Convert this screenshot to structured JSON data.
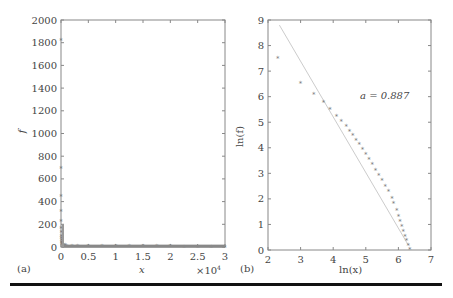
{
  "chart_data": [
    {
      "panel": "(a)",
      "type": "scatter",
      "title": "",
      "xlabel": "x",
      "ylabel": "f",
      "x_multiplier": "×10⁴",
      "xlim": [
        0,
        3
      ],
      "ylim": [
        0,
        2000
      ],
      "xticks": [
        "0",
        "0.5",
        "1",
        "1.5",
        "2",
        "2.5",
        "3"
      ],
      "yticks": [
        "0",
        "200",
        "400",
        "600",
        "800",
        "1000",
        "1200",
        "1400",
        "1600",
        "1800",
        "2000"
      ],
      "grid": false,
      "marker": "*",
      "points": [
        [
          0.0002,
          1820
        ],
        [
          0.0005,
          700
        ],
        [
          0.0008,
          450
        ],
        [
          0.001,
          320
        ],
        [
          0.0015,
          230
        ],
        [
          0.002,
          170
        ],
        [
          0.003,
          130
        ],
        [
          0.004,
          100
        ],
        [
          0.005,
          80
        ],
        [
          0.007,
          60
        ],
        [
          0.01,
          45
        ],
        [
          0.015,
          35
        ],
        [
          0.02,
          28
        ],
        [
          0.03,
          22
        ],
        [
          0.05,
          18
        ],
        [
          0.08,
          14
        ],
        [
          0.1,
          12
        ],
        [
          0.2,
          10
        ],
        [
          0.3,
          9
        ],
        [
          0.5,
          8
        ],
        [
          0.75,
          7
        ],
        [
          1.0,
          7
        ],
        [
          1.25,
          6
        ],
        [
          1.5,
          6
        ],
        [
          1.75,
          5
        ],
        [
          2.0,
          5
        ],
        [
          2.25,
          4
        ],
        [
          2.5,
          4
        ],
        [
          2.75,
          3
        ],
        [
          3.0,
          3
        ]
      ]
    },
    {
      "panel": "(b)",
      "type": "scatter",
      "title": "",
      "xlabel": "ln(x)",
      "ylabel": "ln(f)",
      "xlim": [
        2,
        7
      ],
      "ylim": [
        0,
        9
      ],
      "xticks": [
        "2",
        "3",
        "4",
        "5",
        "6",
        "7"
      ],
      "yticks": [
        "0",
        "1",
        "2",
        "3",
        "4",
        "5",
        "6",
        "7",
        "8",
        "9"
      ],
      "grid": false,
      "annotation": "a = 0.887",
      "marker": "*",
      "points": [
        [
          2.3,
          7.5
        ],
        [
          3.0,
          6.55
        ],
        [
          3.4,
          6.1
        ],
        [
          3.7,
          5.8
        ],
        [
          3.9,
          5.5
        ],
        [
          4.1,
          5.25
        ],
        [
          4.25,
          5.05
        ],
        [
          4.4,
          4.85
        ],
        [
          4.5,
          4.65
        ],
        [
          4.6,
          4.5
        ],
        [
          4.7,
          4.3
        ],
        [
          4.8,
          4.15
        ],
        [
          4.9,
          3.95
        ],
        [
          5.0,
          3.75
        ],
        [
          5.1,
          3.55
        ],
        [
          5.2,
          3.35
        ],
        [
          5.3,
          3.15
        ],
        [
          5.4,
          2.95
        ],
        [
          5.5,
          2.75
        ],
        [
          5.6,
          2.5
        ],
        [
          5.7,
          2.3
        ],
        [
          5.8,
          2.05
        ],
        [
          5.85,
          1.85
        ],
        [
          5.95,
          1.55
        ],
        [
          6.0,
          1.35
        ],
        [
          6.05,
          1.15
        ],
        [
          6.1,
          0.95
        ],
        [
          6.15,
          0.75
        ],
        [
          6.2,
          0.55
        ],
        [
          6.25,
          0.4
        ],
        [
          6.3,
          0.2
        ],
        [
          6.35,
          0.05
        ]
      ],
      "fit_line": {
        "x": [
          2.35,
          6.3
        ],
        "y": [
          8.8,
          0.2
        ]
      }
    }
  ],
  "labels": {
    "panel_a": "(a)",
    "panel_b": "(b)",
    "a_xlabel": "x",
    "a_ylabel": "f",
    "a_multiplier": "×10",
    "a_multiplier_exp": "4",
    "b_xlabel": "ln(x)",
    "b_ylabel": "ln(f)",
    "b_annotation": "a = 0.887"
  }
}
